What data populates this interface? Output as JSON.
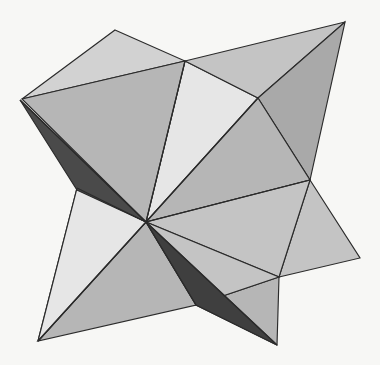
{
  "figure": {
    "subject_name": "star-tetrahedron-stellation",
    "canvas": {
      "width": 380,
      "height": 365
    },
    "background_color": "#f7f7f5",
    "edge_color": "#2b2b2b",
    "edge_width": 1.15
  },
  "palette": {
    "highlight": "#e6e6e6",
    "light": "#d2d2d2",
    "mid_light": "#c4c4c4",
    "mid": "#b6b6b6",
    "mid_dark": "#a9a9a9",
    "dark": "#9b9b9b",
    "shadow": "#4a4a4a",
    "deep_shadow": "#3f3f3f"
  },
  "vertices": {
    "spike_top_left": [
      115,
      30
    ],
    "spike_top_right": [
      345,
      22
    ],
    "spike_left": [
      20,
      100
    ],
    "spike_right": [
      360,
      258
    ],
    "spike_bottom_left": [
      38,
      341
    ],
    "spike_bottom_right": [
      277,
      345
    ],
    "node_top_mid": [
      185,
      61
    ],
    "node_upper_right": [
      258,
      98
    ],
    "node_right_mid": [
      310,
      180
    ],
    "node_left_mid": [
      77,
      188
    ],
    "node_lower_mid": [
      196,
      305
    ],
    "node_center": [
      146,
      222
    ],
    "edge_left_lower": [
      76,
      190
    ],
    "edge_bottom_mid": [
      200,
      302
    ]
  },
  "faces": [
    {
      "name": "top-left-spike-face",
      "tone": "light",
      "points": "115,30 185,61 22,99"
    },
    {
      "name": "upper-light-wedge",
      "tone": "highlight",
      "points": "185,61 258,98 146,222"
    },
    {
      "name": "upper-left-large-face",
      "tone": "mid",
      "points": "22,99 185,61 146,222"
    },
    {
      "name": "top-right-spike-face",
      "tone": "mid_light",
      "points": "185,61 345,22 258,98"
    },
    {
      "name": "right-upper-face",
      "tone": "mid_dark",
      "points": "258,98 345,22 310,180"
    },
    {
      "name": "right-inner-face",
      "tone": "mid",
      "points": "258,98 310,180 146,222"
    },
    {
      "name": "right-spike-face",
      "tone": "mid_light",
      "points": "310,180 360,258 279,277"
    },
    {
      "name": "right-lower-face",
      "tone": "mid_light",
      "points": "310,180 279,277 146,222"
    },
    {
      "name": "bottom-right-spike-face",
      "tone": "mid",
      "points": "279,277 277,345 196,305"
    },
    {
      "name": "bottom-mid-face",
      "tone": "mid_light",
      "points": "279,277 196,305 146,222"
    },
    {
      "name": "bottom-left-lower-face",
      "tone": "mid",
      "points": "146,222 196,305 38,341"
    },
    {
      "name": "bottom-left-spike-face",
      "tone": "light",
      "points": "38,341 146,222 77,188"
    },
    {
      "name": "left-lower-face",
      "tone": "highlight",
      "points": "77,188 146,222 38,341"
    },
    {
      "name": "left-shadow-band",
      "tone": "shadow",
      "points": "20,100 146,222 77,190"
    },
    {
      "name": "bottom-shadow-band",
      "tone": "deep_shadow",
      "points": "146,222 277,345 196,305"
    }
  ],
  "edges": [
    {
      "name": "edge-center-to-top-mid",
      "from": "node_center",
      "to": "node_top_mid"
    },
    {
      "name": "edge-center-to-upper-right",
      "from": "node_center",
      "to": "node_upper_right"
    },
    {
      "name": "edge-center-to-right-mid",
      "from": "node_center",
      "to": "node_right_mid"
    },
    {
      "name": "edge-center-to-left-mid",
      "from": "node_center",
      "to": "node_left_mid"
    },
    {
      "name": "edge-center-to-lower-mid",
      "from": "node_center",
      "to": "node_lower_mid"
    },
    {
      "name": "edge-center-to-bottom-left",
      "from": "node_center",
      "to": "spike_bottom_left"
    },
    {
      "name": "edge-center-to-bottom-right",
      "from": "node_center",
      "to": "spike_bottom_right"
    },
    {
      "name": "edge-center-to-left-spike",
      "from": "node_center",
      "to": "spike_left"
    }
  ]
}
